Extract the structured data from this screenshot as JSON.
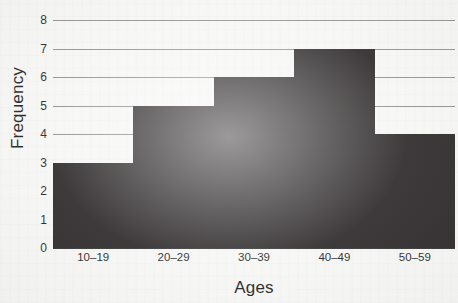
{
  "chart_data": {
    "type": "bar",
    "title": "",
    "xlabel": "Ages",
    "ylabel": "Frequency",
    "categories": [
      "10–19",
      "20–29",
      "30–39",
      "40–49",
      "50–59"
    ],
    "values": [
      3,
      5,
      6,
      7,
      4
    ],
    "ylim": [
      0,
      8
    ],
    "yticks": [
      0,
      1,
      2,
      3,
      4,
      5,
      6,
      7,
      8
    ],
    "ytick_labels": [
      "0",
      "1",
      "2",
      "3",
      "4",
      "5",
      "6",
      "7",
      "8"
    ],
    "grid": "horizontal",
    "legend": "none",
    "bar_gap": 0,
    "series": [
      {
        "name": "Frequency",
        "values": [
          3,
          5,
          6,
          7,
          4
        ]
      }
    ],
    "colors": {
      "bar": "#231f20",
      "gridline": "#8d8d8d",
      "axis": "#2b2b2b",
      "background": "#f6f6f5",
      "text": "#1b1b1b"
    }
  }
}
